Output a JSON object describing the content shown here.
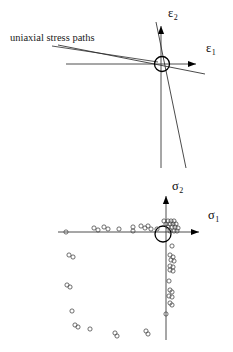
{
  "figure": {
    "background": "#ffffff",
    "ink": "#000000",
    "width": 233,
    "height": 352
  },
  "panels": [
    {
      "id": "strain-panel",
      "name": "strain-space-diagram",
      "origin": {
        "x": 162,
        "y": 64
      },
      "annotation": {
        "text": "uniaxial stress paths",
        "x": 10,
        "y": 41,
        "leader": {
          "x1": 52,
          "y1": 46,
          "x2": 158,
          "y2": 62
        }
      },
      "axes": [
        {
          "name": "epsilon-2-axis",
          "label": "ε",
          "subscript": "2",
          "label_x": 168,
          "label_y": 17,
          "direction": "up",
          "x1": 161,
          "y1": 168,
          "x2": 161,
          "y2": 26,
          "arrow": {
            "x": 161,
            "y": 26
          }
        },
        {
          "name": "epsilon-1-axis",
          "label": "ε",
          "subscript": "1",
          "label_x": 206,
          "label_y": 52,
          "direction": "right",
          "x1": 66,
          "y1": 64,
          "x2": 196,
          "y2": 64,
          "arrow": {
            "x": 196,
            "y": 64
          }
        }
      ],
      "stress_paths": [
        {
          "name": "steep-path",
          "x1": 156,
          "y1": 22,
          "x2": 186,
          "y2": 168
        },
        {
          "name": "shallow-path",
          "x1": 58,
          "y1": 45,
          "x2": 205,
          "y2": 74
        }
      ],
      "origin_marker": {
        "name": "origin-ring",
        "cx": 162,
        "cy": 64,
        "r": 7.5
      }
    },
    {
      "id": "stress-panel",
      "name": "stress-space-diagram",
      "origin": {
        "x": 166,
        "y": 232
      },
      "axes": [
        {
          "name": "sigma-2-axis",
          "label": "σ",
          "subscript": "2",
          "label_x": 172,
          "label_y": 190,
          "direction": "up",
          "x1": 166,
          "y1": 340,
          "x2": 166,
          "y2": 196,
          "arrow": {
            "x": 166,
            "y": 196
          }
        },
        {
          "name": "sigma-1-axis",
          "label": "σ",
          "subscript": "1",
          "label_x": 208,
          "label_y": 219,
          "direction": "right",
          "x1": 58,
          "y1": 232,
          "x2": 199,
          "y2": 232,
          "arrow": {
            "x": 199,
            "y": 232
          }
        }
      ],
      "origin_marker": {
        "name": "origin-ring",
        "cx": 163,
        "cy": 234,
        "r": 8
      }
    }
  ],
  "chart_data": {
    "type": "scatter",
    "title": "",
    "xlabel": "σ₁",
    "ylabel": "σ₂",
    "grid": false,
    "legend": null,
    "origin_px": {
      "x": 166,
      "y": 232
    },
    "marker": "open-circle",
    "marker_radius_px": 2.1,
    "note": "Failure points in principal stress space; pixel coordinates as rendered.",
    "groups": [
      {
        "name": "negative-sigma1-branch",
        "points_px": [
          {
            "x": 66,
            "y": 232
          },
          {
            "x": 94,
            "y": 228
          },
          {
            "x": 98,
            "y": 230
          },
          {
            "x": 104,
            "y": 227
          },
          {
            "x": 108,
            "y": 229
          },
          {
            "x": 119,
            "y": 229
          },
          {
            "x": 133,
            "y": 227
          },
          {
            "x": 133,
            "y": 231
          },
          {
            "x": 141,
            "y": 226
          },
          {
            "x": 145,
            "y": 228
          },
          {
            "x": 148,
            "y": 226
          },
          {
            "x": 151,
            "y": 229
          },
          {
            "x": 157,
            "y": 229
          }
        ]
      },
      {
        "name": "origin-cluster",
        "points_px": [
          {
            "x": 164,
            "y": 221
          },
          {
            "x": 168,
            "y": 221
          },
          {
            "x": 171,
            "y": 221
          },
          {
            "x": 174,
            "y": 221
          },
          {
            "x": 166,
            "y": 224
          },
          {
            "x": 170,
            "y": 224
          },
          {
            "x": 173,
            "y": 224
          },
          {
            "x": 176,
            "y": 224
          },
          {
            "x": 168,
            "y": 227
          },
          {
            "x": 172,
            "y": 227
          },
          {
            "x": 175,
            "y": 227
          },
          {
            "x": 178,
            "y": 228
          },
          {
            "x": 170,
            "y": 231
          },
          {
            "x": 174,
            "y": 231
          },
          {
            "x": 177,
            "y": 231
          }
        ]
      },
      {
        "name": "negative-sigma2-branch",
        "points_px": [
          {
            "x": 172,
            "y": 246
          },
          {
            "x": 170,
            "y": 255
          },
          {
            "x": 173,
            "y": 257
          },
          {
            "x": 171,
            "y": 260
          },
          {
            "x": 174,
            "y": 261
          },
          {
            "x": 170,
            "y": 266
          },
          {
            "x": 173,
            "y": 267
          },
          {
            "x": 170,
            "y": 270
          },
          {
            "x": 173,
            "y": 271
          },
          {
            "x": 169,
            "y": 281
          },
          {
            "x": 170,
            "y": 290
          },
          {
            "x": 172,
            "y": 292
          },
          {
            "x": 169,
            "y": 296
          },
          {
            "x": 172,
            "y": 297
          },
          {
            "x": 170,
            "y": 303
          },
          {
            "x": 172,
            "y": 305
          },
          {
            "x": 166,
            "y": 314
          }
        ]
      },
      {
        "name": "third-quadrant-envelope",
        "points_px": [
          {
            "x": 69,
            "y": 255
          },
          {
            "x": 73,
            "y": 257
          },
          {
            "x": 67,
            "y": 285
          },
          {
            "x": 70,
            "y": 287
          },
          {
            "x": 72,
            "y": 311
          },
          {
            "x": 75,
            "y": 325
          },
          {
            "x": 78,
            "y": 327
          },
          {
            "x": 90,
            "y": 329
          },
          {
            "x": 115,
            "y": 333
          },
          {
            "x": 117,
            "y": 336
          },
          {
            "x": 146,
            "y": 331
          },
          {
            "x": 148,
            "y": 334
          }
        ]
      }
    ]
  }
}
